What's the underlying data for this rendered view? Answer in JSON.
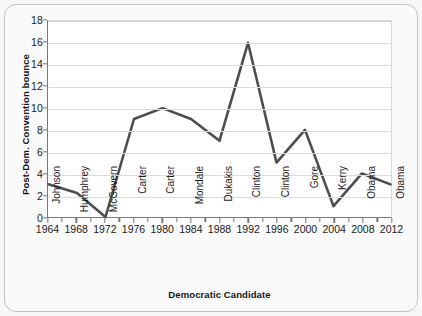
{
  "chart_data": {
    "type": "line",
    "title": "",
    "xlabel": "Democratic Candidate",
    "ylabel": "Post-Dem. Convention bounce",
    "ylim": [
      0,
      18
    ],
    "ytick_step": 2,
    "yticks": [
      0,
      2,
      4,
      6,
      8,
      10,
      12,
      14,
      16,
      18
    ],
    "grid": true,
    "legend": "none",
    "x": [
      1964,
      1968,
      1972,
      1976,
      1980,
      1984,
      1988,
      1992,
      1996,
      2000,
      2004,
      2008,
      2012
    ],
    "categories": [
      "1964",
      "1968",
      "1972",
      "1976",
      "1980",
      "1984",
      "1988",
      "1992",
      "1996",
      "2000",
      "2004",
      "2008",
      "2012"
    ],
    "candidates": [
      "Johnson",
      "Humphrey",
      "McGovern",
      "Carter",
      "Carter",
      "Mondale",
      "Dukakis",
      "Clinton",
      "Clinton",
      "Gore",
      "Kerry",
      "Obama",
      "Obama"
    ],
    "values": [
      3,
      2.2,
      0,
      9,
      10,
      9,
      7,
      16,
      5,
      8,
      1,
      4,
      3
    ],
    "series": [
      {
        "name": "Post-Dem. Convention bounce",
        "color": "#4d4d4d",
        "values": [
          3,
          2.2,
          0,
          9,
          10,
          9,
          7,
          16,
          5,
          8,
          1,
          4,
          3
        ]
      }
    ],
    "line_color": "#4d4d4d",
    "grid_color": "#dcdcdc",
    "axis_color": "#7a7a7a"
  }
}
